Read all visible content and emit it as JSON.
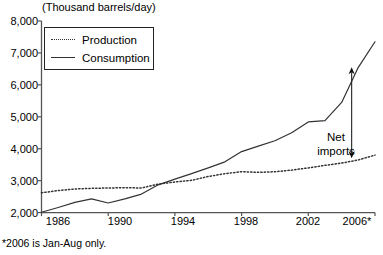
{
  "chart_data": {
    "type": "line",
    "title": "(Thousand barrels/day)",
    "xlabel": "",
    "ylabel": "(Thousand barrels/day)",
    "xlim": [
      1986,
      2006
    ],
    "ylim": [
      2000,
      8000
    ],
    "grid": false,
    "legend_position": "top-left",
    "xtick_labels": [
      "1986",
      "1990",
      "1994",
      "1998",
      "2002",
      "2006*"
    ],
    "xticks": [
      1986,
      1990,
      1994,
      1998,
      2002,
      2006
    ],
    "ytick_labels": [
      "2,000",
      "3,000",
      "4,000",
      "5,000",
      "6,000",
      "7,000",
      "8,000"
    ],
    "yticks": [
      2000,
      3000,
      4000,
      5000,
      6000,
      7000,
      8000
    ],
    "x": [
      1986,
      1987,
      1988,
      1989,
      1990,
      1991,
      1992,
      1993,
      1994,
      1995,
      1996,
      1997,
      1998,
      1999,
      2000,
      2001,
      2002,
      2003,
      2004,
      2005,
      2006
    ],
    "series": [
      {
        "name": "Production",
        "style": "dotted",
        "color": "#333333",
        "values": [
          2620,
          2690,
          2740,
          2760,
          2770,
          2780,
          2770,
          2890,
          2960,
          3010,
          3130,
          3220,
          3280,
          3260,
          3280,
          3330,
          3400,
          3480,
          3550,
          3650,
          3800
        ]
      },
      {
        "name": "Consumption",
        "style": "solid",
        "color": "#333333",
        "values": [
          2010,
          2160,
          2320,
          2430,
          2300,
          2430,
          2580,
          2870,
          3050,
          3220,
          3400,
          3590,
          3910,
          4080,
          4250,
          4500,
          4840,
          4880,
          5450,
          6550,
          7350
        ]
      }
    ],
    "annotations": [
      {
        "name": "net-imports",
        "label_line1": "Net",
        "label_line2": "imports",
        "arrow_x_year": 2004.6,
        "arrow_top_value": 6550,
        "arrow_bottom_value": 3700,
        "double_headed": true
      }
    ],
    "footnote": "*2006 is Jan-Aug only."
  },
  "legend": {
    "items": [
      {
        "label": "Production",
        "style": "dotted"
      },
      {
        "label": "Consumption",
        "style": "solid"
      }
    ]
  },
  "axes": {
    "title": "(Thousand barrels/day)",
    "y_labels": [
      "8,000",
      "7,000",
      "6,000",
      "5,000",
      "4,000",
      "3,000",
      "2,000"
    ],
    "x_labels": [
      "1986",
      "1990",
      "1994",
      "1998",
      "2002",
      "2006*"
    ]
  },
  "annotation": {
    "line1": "Net",
    "line2": "imports"
  },
  "footnote": {
    "text": "*2006 is Jan-Aug only."
  },
  "colors": {
    "line": "#333333",
    "axis": "#555555",
    "text": "#000000",
    "background": "#ffffff"
  }
}
